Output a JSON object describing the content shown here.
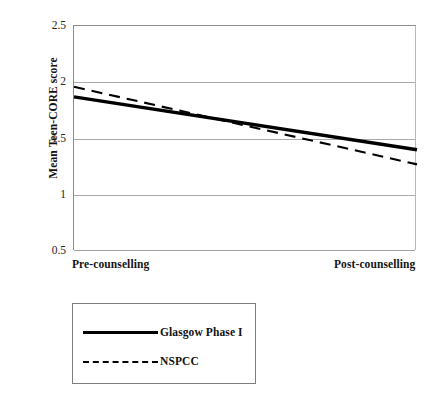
{
  "chart_data": {
    "type": "line",
    "title": "",
    "subtitle": "",
    "xlabel": "",
    "ylabel": "Mean Teen-CORE score",
    "categories": [
      "Pre-counselling",
      "Post-counselling"
    ],
    "x": [
      0,
      1
    ],
    "ylim": [
      0.5,
      2.5
    ],
    "yticks": [
      "2.5",
      "2",
      "1.5",
      "1",
      "0.5"
    ],
    "ytick_values": [
      2.5,
      2.0,
      1.5,
      1.0,
      0.5
    ],
    "grid": "horizontal",
    "legend_position": "below-plot-left",
    "series": [
      {
        "name": "Glasgow Phase I",
        "style": "solid",
        "color": "#000000",
        "values": [
          1.87,
          1.4
        ]
      },
      {
        "name": "NSPCC",
        "style": "dashed",
        "color": "#000000",
        "values": [
          1.96,
          1.27
        ]
      }
    ],
    "annotations": []
  },
  "axes": {
    "y_title": "Mean Teen-CORE score",
    "y_ticks": [
      {
        "label": "2.5",
        "value": 2.5
      },
      {
        "label": "2",
        "value": 2.0
      },
      {
        "label": "1.5",
        "value": 1.5
      },
      {
        "label": "1",
        "value": 1.0
      },
      {
        "label": "0.5",
        "value": 0.5
      }
    ],
    "x_labels": {
      "left": "Pre-counselling",
      "right": "Post-counselling"
    }
  },
  "legend": {
    "items": [
      {
        "label": "Glasgow Phase I",
        "style": "solid"
      },
      {
        "label": "NSPCC",
        "style": "dashed"
      }
    ]
  },
  "colors": {
    "series_line": "#000000",
    "gridline": "#a9a9a9",
    "axis": "#8b8b8b",
    "text": "#141414",
    "background": "#ffffff"
  }
}
